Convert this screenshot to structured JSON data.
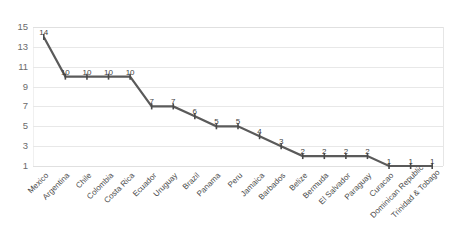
{
  "chart_data": {
    "type": "line",
    "title": "",
    "subtitle": "",
    "xlabel": "",
    "ylabel": "",
    "ylim": [
      1,
      15
    ],
    "y_ticks": [
      1,
      3,
      5,
      7,
      9,
      11,
      13,
      15
    ],
    "grid": true,
    "legend": "none",
    "show_data_labels": true,
    "line_color": "#5a5a5a",
    "gridline_color": "#e8e8e8",
    "categories": [
      "Mexico",
      "Argentina",
      "Chile",
      "Colombia",
      "Costa Rica",
      "Ecuador",
      "Uruguay",
      "Brazil",
      "Panama",
      "Peru",
      "Jamaica",
      "Barbados",
      "Belize",
      "Bermuda",
      "El Salvador",
      "Paraguay",
      "Curacao",
      "Dominican Republic",
      "Trinidad & Tobago"
    ],
    "values": [
      14,
      10,
      10,
      10,
      10,
      7,
      7,
      6,
      5,
      5,
      4,
      3,
      2,
      2,
      2,
      2,
      1,
      1,
      1
    ],
    "point_labels": [
      "14",
      "10",
      "10",
      "10",
      "10",
      "7",
      "7",
      "6",
      "5",
      "5",
      "4",
      "3",
      "2",
      "2",
      "2",
      "2",
      "1",
      "1",
      "1"
    ],
    "y_tick_labels": [
      "1",
      "3",
      "5",
      "7",
      "9",
      "11",
      "13",
      "15"
    ]
  }
}
